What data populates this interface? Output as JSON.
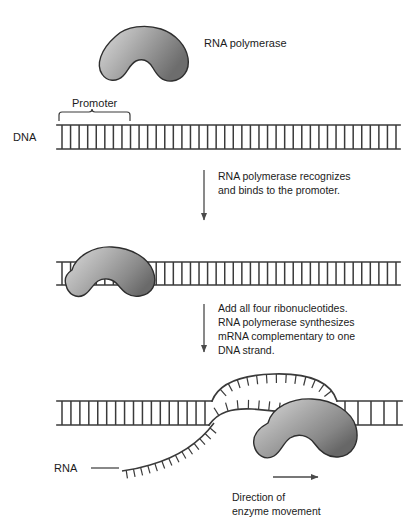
{
  "figure": {
    "title_alt": "Transcription: RNA polymerase binding and mRNA synthesis",
    "background_color": "#ffffff",
    "ink_color": "#3a3a3a"
  },
  "labels": {
    "rna_polymerase": "RNA polymerase",
    "promoter": "Promoter",
    "dna": "DNA",
    "rna": "RNA",
    "direction_line1": "Direction of",
    "direction_line2": "enzyme movement"
  },
  "captions": [
    {
      "id": "caption-bind",
      "lines": [
        "RNA polymerase recognizes",
        "and binds to the promoter."
      ]
    },
    {
      "id": "caption-synthesize",
      "lines": [
        "Add all four ribonucleotides.",
        "RNA polymerase synthesizes",
        "mRNA complementary to one",
        "DNA strand."
      ]
    }
  ],
  "stages": [
    {
      "id": "stage-1",
      "name": "free-polymerase-and-dna",
      "dna_rungs": 40,
      "promoter_rungs": 9,
      "enzyme_bound": false
    },
    {
      "id": "stage-2",
      "name": "polymerase-bound-at-promoter",
      "dna_rungs": 40,
      "enzyme_bound": true
    },
    {
      "id": "stage-3",
      "name": "transcription-bubble-with-rna",
      "dna_rungs_left": 17,
      "dna_rungs_right": 5,
      "bubble_top_ticks": 13,
      "bubble_bottom_ticks": 8,
      "rna_ticks": 14,
      "enzyme_bound": true
    }
  ],
  "colors": {
    "enzyme_light": "#d6d6d6",
    "enzyme_mid": "#9e9e9e",
    "enzyme_dark": "#6f6f6f",
    "enzyme_outline": "#2e2e2e",
    "strand": "#3a3a3a",
    "text": "#1b1b1b"
  }
}
